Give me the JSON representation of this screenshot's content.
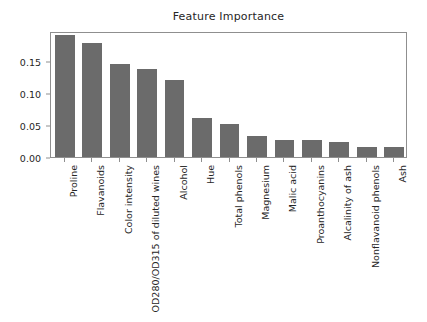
{
  "chart_data": {
    "type": "bar",
    "title": "Feature Importance",
    "xlabel": "",
    "ylabel": "",
    "ylim": [
      0.0,
      0.196
    ],
    "yticks": [
      "0.00",
      "0.05",
      "0.10",
      "0.15"
    ],
    "ytick_values": [
      0.0,
      0.05,
      0.1,
      0.15
    ],
    "grid": false,
    "legend": null,
    "orientation": "vertical",
    "bar_color": "#6b6b6b",
    "categories": [
      "Proline",
      "Flavanoids",
      "Color intensity",
      "OD280/OD315 of diluted wines",
      "Alcohol",
      "Hue",
      "Total phenols",
      "Magnesium",
      "Malic acid",
      "Proanthocyanins",
      "Alcalinity of ash",
      "Nonflavanoid phenols",
      "Ash"
    ],
    "values": [
      0.19,
      0.178,
      0.145,
      0.137,
      0.12,
      0.06,
      0.052,
      0.032,
      0.027,
      0.027,
      0.023,
      0.015,
      0.015
    ]
  },
  "colors": {
    "background": "#ffffff",
    "axis": "#8f8f8f",
    "text": "#262626",
    "bar": "#6b6b6b"
  }
}
